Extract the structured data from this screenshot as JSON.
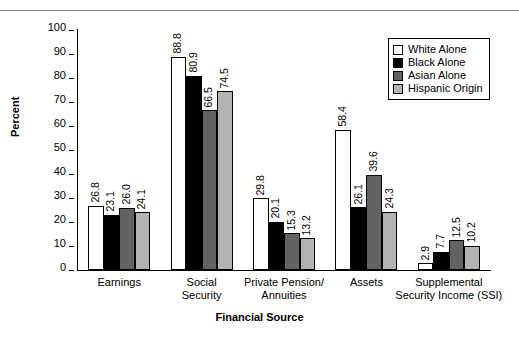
{
  "chart_data": {
    "type": "bar",
    "title": "",
    "xlabel": "Financial Source",
    "ylabel": "Percent",
    "ylim": [
      0,
      100
    ],
    "yticks": [
      0,
      10,
      20,
      30,
      40,
      50,
      60,
      70,
      80,
      90,
      100
    ],
    "grid": false,
    "legend_position": "top-right",
    "categories": [
      "Earnings",
      "Social Security",
      "Private Pension/ Annuities",
      "Assets",
      "Supplemental Security Income (SSI)"
    ],
    "category_lines": [
      [
        "Earnings"
      ],
      [
        "Social",
        "Security"
      ],
      [
        "Private Pension/",
        "Annuities"
      ],
      [
        "Assets"
      ],
      [
        "Supplemental",
        "Security Income (SSI)"
      ]
    ],
    "series": [
      {
        "name": "White Alone",
        "color": "#ffffff",
        "values": [
          26.8,
          88.8,
          29.8,
          58.4,
          2.9
        ],
        "labels": [
          "26.8",
          "88.8",
          "29.8",
          "58.4",
          "2.9"
        ]
      },
      {
        "name": "Black Alone",
        "color": "#000000",
        "values": [
          23.1,
          80.9,
          20.1,
          26.1,
          7.7
        ],
        "labels": [
          "23.1",
          "80.9",
          "20.1",
          "26.1",
          "7.7"
        ]
      },
      {
        "name": "Asian Alone",
        "color": "#636363",
        "values": [
          26.0,
          66.5,
          15.3,
          39.6,
          12.5
        ],
        "labels": [
          "26.0",
          "66.5",
          "15.3",
          "39.6",
          "12.5"
        ]
      },
      {
        "name": "Hispanic Origin",
        "color": "#b3b3b3",
        "values": [
          24.1,
          74.5,
          13.2,
          24.3,
          10.2
        ],
        "labels": [
          "24.1",
          "74.5",
          "13.2",
          "24.3",
          "10.2"
        ]
      }
    ]
  }
}
